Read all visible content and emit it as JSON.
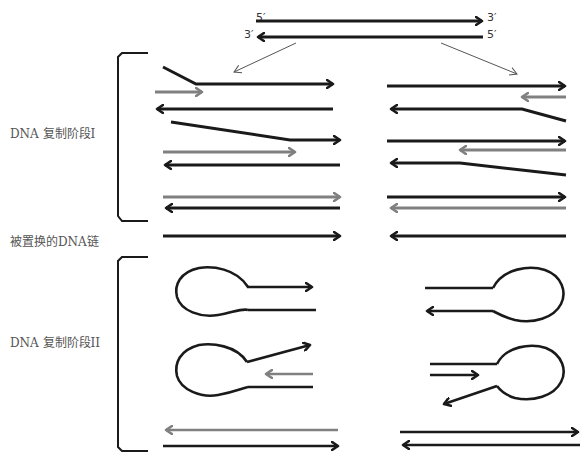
{
  "parent_duplex": {
    "top_strand": {
      "left_end": "5′",
      "right_end": "3′"
    },
    "bottom_strand": {
      "left_end": "3′",
      "right_end": "5′"
    }
  },
  "labels": {
    "phase1": "DNA 复制阶段I",
    "displaced": "被置换的DNA链",
    "phase2": "DNA 复制阶段II"
  },
  "colors": {
    "template_strand": "#1a1a1a",
    "new_strand": "#808080",
    "pointer": "#555555"
  }
}
